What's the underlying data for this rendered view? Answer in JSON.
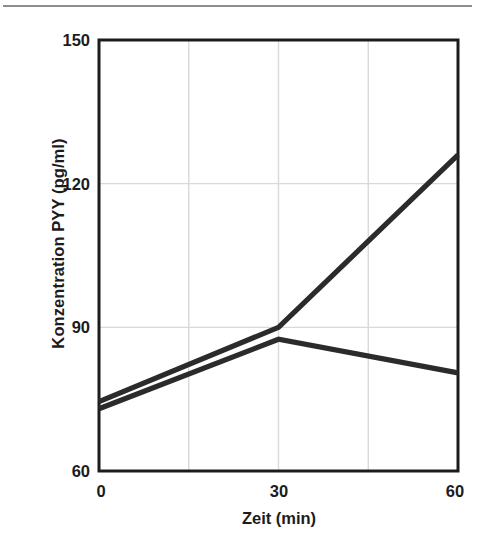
{
  "figure": {
    "top_rule": true,
    "background_color": "#ffffff",
    "line_color": "#2b2b2b",
    "grid_color": "#d9d9d9",
    "axis_color": "#1c1c1c"
  },
  "chart_data": {
    "type": "line",
    "title": "",
    "xlabel": "Zeit (min)",
    "ylabel": "Konzentration PYY (pg/ml)",
    "xlim": [
      0,
      60
    ],
    "ylim": [
      60,
      150
    ],
    "x_ticks": [
      "0",
      "30",
      "60"
    ],
    "x_tick_values": [
      0,
      30,
      60
    ],
    "y_ticks": [
      "60",
      "90",
      "120",
      "150"
    ],
    "y_tick_values": [
      60,
      90,
      120,
      150
    ],
    "grid": true,
    "grid_x_values": [
      15,
      30,
      45
    ],
    "grid_y_values": [
      90,
      120
    ],
    "legend": "none",
    "x": [
      0,
      30,
      60
    ],
    "series": [
      {
        "name": "Serie 1",
        "values": [
          74.5,
          90,
          126
        ]
      },
      {
        "name": "Serie 2",
        "values": [
          73,
          87.5,
          80.5
        ]
      }
    ]
  }
}
